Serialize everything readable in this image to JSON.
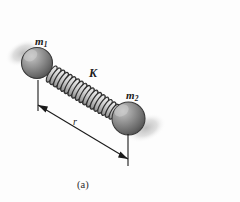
{
  "figure": {
    "caption": "(a)",
    "background_color": "#fdfdfd",
    "ink_color": "#1a1a1a",
    "labels": {
      "mass1": {
        "symbol": "m",
        "subscript": "1",
        "text": "m1"
      },
      "mass2": {
        "symbol": "m",
        "subscript": "2",
        "text": "m2"
      },
      "spring_constant": "K",
      "separation": "r"
    },
    "elements": {
      "sphere1_name": "mass-sphere-m1",
      "sphere2_name": "mass-sphere-m2",
      "spring_name": "coil-spring",
      "dimension_name": "separation-dimension-line"
    },
    "geometry": {
      "sphere1": {
        "cx": 37,
        "cy": 63,
        "r": 15.5
      },
      "sphere2": {
        "cx": 128.5,
        "cy": 118.5,
        "r": 16.5
      },
      "spring": {
        "x1": 50,
        "y1": 73,
        "x2": 116,
        "y2": 113,
        "coils": 17,
        "amplitude": 9.5
      },
      "dimension": {
        "x1": 38,
        "y1": 105,
        "x2": 128,
        "y2": 159
      },
      "extension_left": {
        "x": 38,
        "y1": 80,
        "y2": 111
      },
      "extension_right": {
        "x": 128,
        "y1": 134,
        "y2": 166
      }
    },
    "colors": {
      "sphere_light": "#c2c2c2",
      "sphere_mid": "#8e8e8e",
      "sphere_dark": "#555555",
      "sphere_edge": "#3a3a3a",
      "shadow": "#d9d9d9",
      "spring_stroke": "#2e2e2e",
      "spring_fill": "#e8e8e8",
      "line": "#1a1a1a"
    }
  }
}
